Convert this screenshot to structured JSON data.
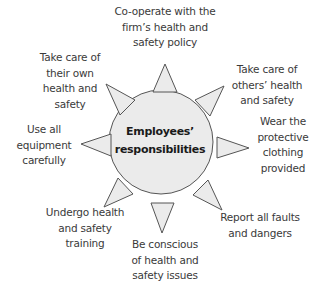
{
  "diagram": {
    "center": {
      "label": "Employees’\nresponsibilities"
    },
    "colors": {
      "fill": "#ebebeb",
      "stroke": "#555555",
      "text": "#3a3a3a"
    },
    "spokes": [
      {
        "direction": "top",
        "label": "Co-operate with the\nfirm’s health and\nsafety policy"
      },
      {
        "direction": "top-right",
        "label": "Take care of\nothers’ health\nand safety"
      },
      {
        "direction": "right",
        "label": "Wear the\nprotective\nclothing\nprovided"
      },
      {
        "direction": "bottom-right",
        "label": "Report all faults\nand dangers"
      },
      {
        "direction": "bottom",
        "label": "Be conscious\nof health and\nsafety issues"
      },
      {
        "direction": "bottom-left",
        "label": "Undergo health\nand safety\ntraining"
      },
      {
        "direction": "left",
        "label": "Use all\nequipment\ncarefully"
      },
      {
        "direction": "top-left",
        "label": "Take care of\ntheir own\nhealth and\nsafety"
      }
    ]
  }
}
